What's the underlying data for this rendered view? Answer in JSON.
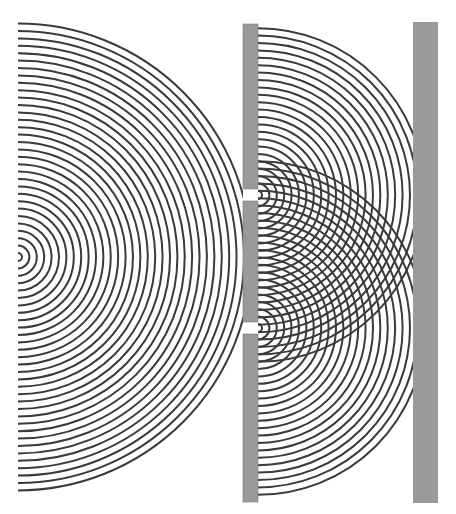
{
  "diagram": {
    "width": 456,
    "height": 514,
    "colors": {
      "background": "#ffffff",
      "wave": "#3a3a3a",
      "barrier": "#9a9a9a",
      "screen": "#9a9a9a"
    },
    "source": {
      "cx": 18,
      "cy": 257,
      "r0": 4,
      "spacing": 7.4,
      "count": 32
    },
    "barrier": {
      "x": 243,
      "width": 15,
      "top": 24,
      "bottom": 502,
      "slits": [
        {
          "name": "upper",
          "top": 189,
          "bottom": 201,
          "cy": 195
        },
        {
          "name": "lower",
          "top": 322,
          "bottom": 334,
          "cy": 328
        }
      ]
    },
    "secondary_waves": {
      "cx": 258,
      "r0": 4,
      "spacing": 7.4,
      "count": 23
    },
    "screen": {
      "x": 413,
      "width": 25,
      "top": 22,
      "bottom": 503
    },
    "wave_stroke_width": 2
  }
}
